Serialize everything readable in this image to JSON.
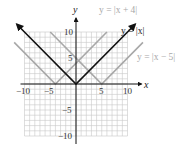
{
  "chart_data": {
    "type": "line",
    "title": "",
    "xlabel": "x",
    "ylabel": "y",
    "xlim": [
      -10,
      10
    ],
    "ylim": [
      -10,
      10
    ],
    "grid": true,
    "grid_step": 1,
    "x_ticks": [
      -10,
      -5,
      5,
      10
    ],
    "x_tick_labels": [
      "−10",
      "−5",
      "5",
      "10"
    ],
    "y_ticks": [
      -10,
      -5,
      5,
      10
    ],
    "y_tick_labels": [
      "−10",
      "−5",
      "5",
      "10"
    ],
    "series": [
      {
        "name": "y = |x + 4|",
        "color": "#a8a8a8",
        "vertex": [
          -4,
          0
        ],
        "points": [
          [
            -12,
            8
          ],
          [
            -4,
            0
          ],
          [
            6,
            10
          ]
        ]
      },
      {
        "name": "y = |x|",
        "color": "#111111",
        "vertex": [
          0,
          0
        ],
        "points": [
          [
            -11.5,
            11.5
          ],
          [
            0,
            0
          ],
          [
            11.5,
            11.5
          ]
        ],
        "arrows": true
      },
      {
        "name": "y = |x − 5|",
        "color": "#a8a8a8",
        "vertex": [
          5,
          0
        ],
        "points": [
          [
            -5,
            10
          ],
          [
            5,
            0
          ],
          [
            13,
            8
          ]
        ]
      }
    ],
    "annotations": [
      {
        "text": "y = |x + 4|",
        "color": "#a8a8a8",
        "position": "top"
      },
      {
        "text": "y = |x|",
        "color": "#222222",
        "position": "upper-right near arrow"
      },
      {
        "text": "y = |x − 5|",
        "color": "#a8a8a8",
        "position": "right"
      }
    ],
    "legend": "none (inline labels)"
  },
  "labels": {
    "x_axis": "x",
    "y_axis": "y",
    "eq_shift_left": "y = |x + 4|",
    "eq_base": "y = |x|",
    "eq_shift_right": "y = |x − 5|",
    "tick_x_neg10": "−10",
    "tick_x_neg5": "−5",
    "tick_x_5": "5",
    "tick_x_10": "10",
    "tick_y_10": "10",
    "tick_y_5": "5",
    "tick_y_neg5": "−5",
    "tick_y_neg10": "−10"
  },
  "colors": {
    "grid": "#c8c8c8",
    "axis": "#111111",
    "base_curve": "#111111",
    "shifted_curves": "#a8a8a8"
  }
}
